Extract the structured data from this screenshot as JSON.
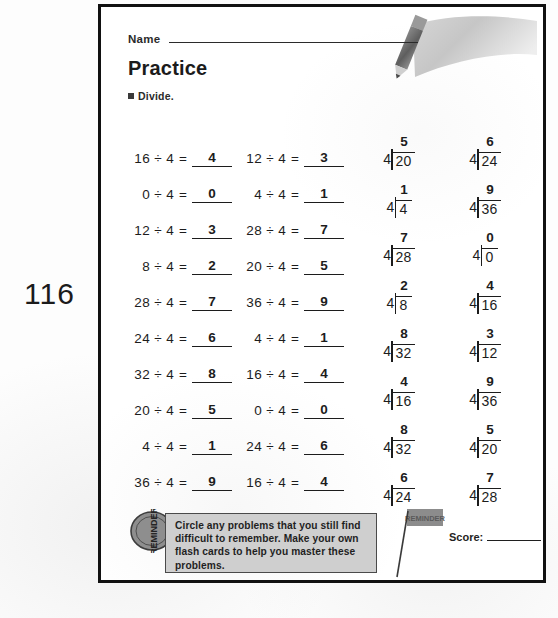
{
  "page_number": "116",
  "worksheet": {
    "name_label": "Name",
    "title": "Practice",
    "directions": "Divide.",
    "score_label": "Score:",
    "reminder_text": "Circle any problems that you still find difficult to remember. Make your own flash cards to help you master these problems.",
    "reminder_badge_text": "REMINDER",
    "flag_text": "REMINDER"
  },
  "chart_data": {
    "type": "table",
    "columns": [
      {
        "name": "column-1",
        "format": "inline",
        "problems": [
          {
            "dividend": 16,
            "divisor": 4,
            "answer": 4
          },
          {
            "dividend": 0,
            "divisor": 4,
            "answer": 0
          },
          {
            "dividend": 12,
            "divisor": 4,
            "answer": 3
          },
          {
            "dividend": 8,
            "divisor": 4,
            "answer": 2
          },
          {
            "dividend": 28,
            "divisor": 4,
            "answer": 7
          },
          {
            "dividend": 24,
            "divisor": 4,
            "answer": 6
          },
          {
            "dividend": 32,
            "divisor": 4,
            "answer": 8
          },
          {
            "dividend": 20,
            "divisor": 4,
            "answer": 5
          },
          {
            "dividend": 4,
            "divisor": 4,
            "answer": 1
          },
          {
            "dividend": 36,
            "divisor": 4,
            "answer": 9
          }
        ]
      },
      {
        "name": "column-2",
        "format": "inline",
        "problems": [
          {
            "dividend": 12,
            "divisor": 4,
            "answer": 3
          },
          {
            "dividend": 4,
            "divisor": 4,
            "answer": 1
          },
          {
            "dividend": 28,
            "divisor": 4,
            "answer": 7
          },
          {
            "dividend": 20,
            "divisor": 4,
            "answer": 5
          },
          {
            "dividend": 36,
            "divisor": 4,
            "answer": 9
          },
          {
            "dividend": 4,
            "divisor": 4,
            "answer": 1
          },
          {
            "dividend": 16,
            "divisor": 4,
            "answer": 4
          },
          {
            "dividend": 0,
            "divisor": 4,
            "answer": 0
          },
          {
            "dividend": 24,
            "divisor": 4,
            "answer": 6
          },
          {
            "dividend": 16,
            "divisor": 4,
            "answer": 4
          }
        ]
      },
      {
        "name": "column-3",
        "format": "long-division",
        "problems": [
          {
            "divisor": 4,
            "dividend": 20,
            "quotient": 5
          },
          {
            "divisor": 4,
            "dividend": 4,
            "quotient": 1
          },
          {
            "divisor": 4,
            "dividend": 28,
            "quotient": 7
          },
          {
            "divisor": 4,
            "dividend": 8,
            "quotient": 2
          },
          {
            "divisor": 4,
            "dividend": 32,
            "quotient": 8
          },
          {
            "divisor": 4,
            "dividend": 16,
            "quotient": 4
          },
          {
            "divisor": 4,
            "dividend": 32,
            "quotient": 8
          },
          {
            "divisor": 4,
            "dividend": 24,
            "quotient": 6
          }
        ]
      },
      {
        "name": "column-4",
        "format": "long-division",
        "problems": [
          {
            "divisor": 4,
            "dividend": 24,
            "quotient": 6
          },
          {
            "divisor": 4,
            "dividend": 36,
            "quotient": 9
          },
          {
            "divisor": 4,
            "dividend": 0,
            "quotient": 0
          },
          {
            "divisor": 4,
            "dividend": 16,
            "quotient": 4
          },
          {
            "divisor": 4,
            "dividend": 12,
            "quotient": 3
          },
          {
            "divisor": 4,
            "dividend": 36,
            "quotient": 9
          },
          {
            "divisor": 4,
            "dividend": 20,
            "quotient": 5
          },
          {
            "divisor": 4,
            "dividend": 28,
            "quotient": 7
          }
        ]
      }
    ]
  },
  "colors": {
    "ink": "#1c1c1c",
    "frame": "#111111",
    "reminder_fill": "#cfcfcf",
    "art_gray": "#b5b5b5"
  }
}
